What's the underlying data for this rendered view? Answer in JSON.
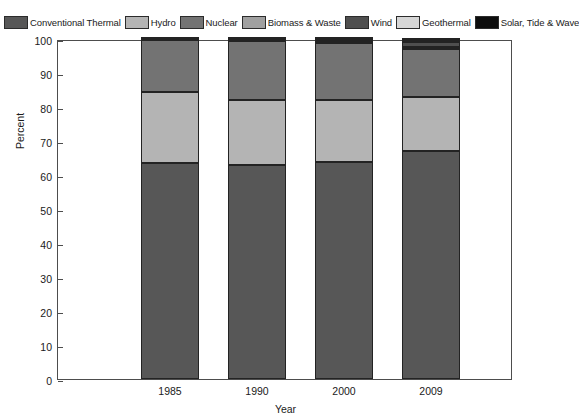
{
  "chart_data": {
    "type": "bar",
    "stacked": true,
    "title": "",
    "xlabel": "Year",
    "ylabel": "Percent",
    "categories": [
      "1985",
      "1990",
      "2000",
      "2009"
    ],
    "ylim": [
      0,
      100
    ],
    "yticks": [
      0,
      10,
      20,
      30,
      40,
      50,
      60,
      70,
      80,
      90,
      100
    ],
    "grid": false,
    "legend_position": "top",
    "series": [
      {
        "name": "Conventional Thermal",
        "color": "#575757",
        "values": [
          63.5,
          63.0,
          63.8,
          67.0
        ]
      },
      {
        "name": "Hydro",
        "color": "#b4b4b4",
        "values": [
          21.0,
          19.0,
          18.2,
          16.0
        ]
      },
      {
        "name": "Nuclear",
        "color": "#737373",
        "values": [
          15.3,
          17.5,
          16.9,
          14.0
        ]
      },
      {
        "name": "Biomass & Waste",
        "color": "#a0a0a0",
        "values": [
          0.1,
          0.3,
          0.5,
          0.7
        ]
      },
      {
        "name": "Wind",
        "color": "#4f4f4f",
        "values": [
          0.0,
          0.1,
          0.3,
          1.5
        ]
      },
      {
        "name": "Geothermal",
        "color": "#d6d6d6",
        "values": [
          0.1,
          0.1,
          0.2,
          0.5
        ]
      },
      {
        "name": "Solar, Tide & Wave",
        "color": "#0d0d0d",
        "values": [
          0.0,
          0.0,
          0.1,
          0.3
        ]
      }
    ]
  },
  "axes": {
    "ylabel": "Percent",
    "xlabel": "Year",
    "ytick_labels": [
      "0",
      "10",
      "20",
      "30",
      "40",
      "50",
      "60",
      "70",
      "80",
      "90",
      "100"
    ],
    "xtick_labels": [
      "1985",
      "1990",
      "2000",
      "2009"
    ]
  },
  "legend": {
    "items": [
      {
        "label": "Conventional Thermal",
        "color": "#575757"
      },
      {
        "label": "Hydro",
        "color": "#b4b4b4"
      },
      {
        "label": "Nuclear",
        "color": "#737373"
      },
      {
        "label": "Biomass & Waste",
        "color": "#a0a0a0"
      },
      {
        "label": "Wind",
        "color": "#4f4f4f"
      },
      {
        "label": "Geothermal",
        "color": "#d6d6d6"
      },
      {
        "label": "Solar, Tide & Wave",
        "color": "#0d0d0d"
      }
    ]
  },
  "style": {
    "background": "#ffffff",
    "axis_color": "#4d4d4d",
    "text_color": "#1a1a1a",
    "segment_border": "#232323"
  }
}
